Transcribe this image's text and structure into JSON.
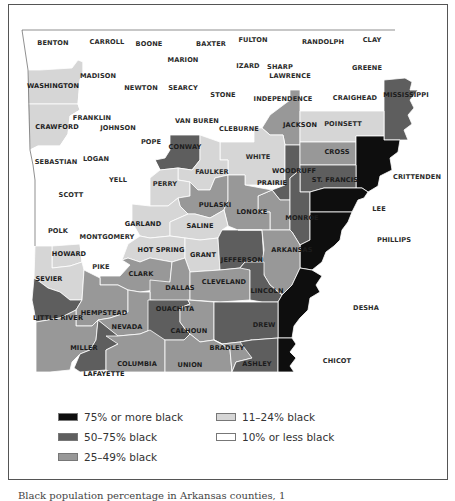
{
  "map": {
    "title": "Arkansas counties by percentage black population",
    "colors": {
      "c75plus": "#0e0e0e",
      "c50_75": "#5e5e5e",
      "c25_49": "#989898",
      "c11_24": "#d6d6d6",
      "c10less": "#ffffff",
      "border": "#ffffff",
      "outline": "#444444"
    },
    "counties": [
      {
        "name": "BENTON",
        "category": "10% or less black"
      },
      {
        "name": "CARROLL",
        "category": "10% or less black"
      },
      {
        "name": "BOONE",
        "category": "10% or less black"
      },
      {
        "name": "BAXTER",
        "category": "10% or less black"
      },
      {
        "name": "FULTON",
        "category": "10% or less black"
      },
      {
        "name": "RANDOLPH",
        "category": "10% or less black"
      },
      {
        "name": "CLAY",
        "category": "10% or less black"
      },
      {
        "name": "MARION",
        "category": "10% or less black"
      },
      {
        "name": "IZARD",
        "category": "10% or less black"
      },
      {
        "name": "SHARP",
        "category": "10% or less black"
      },
      {
        "name": "GREENE",
        "category": "10% or less black"
      },
      {
        "name": "WASHINGTON",
        "category": "11–24% black"
      },
      {
        "name": "MADISON",
        "category": "10% or less black"
      },
      {
        "name": "NEWTON",
        "category": "10% or less black"
      },
      {
        "name": "SEARCY",
        "category": "10% or less black"
      },
      {
        "name": "STONE",
        "category": "10% or less black"
      },
      {
        "name": "LAWRENCE",
        "category": "10% or less black"
      },
      {
        "name": "INDEPENDENCE",
        "category": "10% or less black"
      },
      {
        "name": "CRAIGHEAD",
        "category": "10% or less black"
      },
      {
        "name": "MISSISSIPPI",
        "category": "50–75% black"
      },
      {
        "name": "CRAWFORD",
        "category": "11–24% black"
      },
      {
        "name": "FRANKLIN",
        "category": "10% or less black"
      },
      {
        "name": "JOHNSON",
        "category": "10% or less black"
      },
      {
        "name": "VAN BUREN",
        "category": "10% or less black"
      },
      {
        "name": "CLEBURNE",
        "category": "10% or less black"
      },
      {
        "name": "JACKSON",
        "category": "25–49% black"
      },
      {
        "name": "POINSETT",
        "category": "11–24% black"
      },
      {
        "name": "SEBASTIAN",
        "category": "10% or less black"
      },
      {
        "name": "LOGAN",
        "category": "10% or less black"
      },
      {
        "name": "POPE",
        "category": "10% or less black"
      },
      {
        "name": "CONWAY",
        "category": "50–75% black"
      },
      {
        "name": "WHITE",
        "category": "11–24% black"
      },
      {
        "name": "CROSS",
        "category": "25–49% black"
      },
      {
        "name": "CRITTENDEN",
        "category": "75% or more black"
      },
      {
        "name": "FAULKER",
        "category": "11–24% black"
      },
      {
        "name": "WOODRUFF",
        "category": "50–75% black"
      },
      {
        "name": "ST. FRANCIS",
        "category": "50–75% black"
      },
      {
        "name": "SCOTT",
        "category": "10% or less black"
      },
      {
        "name": "YELL",
        "category": "10% or less black"
      },
      {
        "name": "PERRY",
        "category": "11–24% black"
      },
      {
        "name": "PRAIRIE",
        "category": "25–49% black"
      },
      {
        "name": "PULASKI",
        "category": "25–49% black"
      },
      {
        "name": "LONOKE",
        "category": "25–49% black"
      },
      {
        "name": "MONROE",
        "category": "50–75% black"
      },
      {
        "name": "LEE",
        "category": "75% or more black"
      },
      {
        "name": "GARLAND",
        "category": "11–24% black"
      },
      {
        "name": "SALINE",
        "category": "11–24% black"
      },
      {
        "name": "POLK",
        "category": "10% or less black"
      },
      {
        "name": "MONTGOMERY",
        "category": "10% or less black"
      },
      {
        "name": "PHILLIPS",
        "category": "75% or more black"
      },
      {
        "name": "HOWARD",
        "category": "11–24% black"
      },
      {
        "name": "HOT SPRING",
        "category": "11–24% black"
      },
      {
        "name": "GRANT",
        "category": "11–24% black"
      },
      {
        "name": "JEFFERSON",
        "category": "50–75% black"
      },
      {
        "name": "ARKANSAS",
        "category": "25–49% black"
      },
      {
        "name": "PIKE",
        "category": "10% or less black"
      },
      {
        "name": "SEVIER",
        "category": "11–24% black"
      },
      {
        "name": "CLARK",
        "category": "25–49% black"
      },
      {
        "name": "DALLAS",
        "category": "25–49% black"
      },
      {
        "name": "CLEVELAND",
        "category": "25–49% black"
      },
      {
        "name": "LINCOLN",
        "category": "50–75% black"
      },
      {
        "name": "LITTLE RIVER",
        "category": "50–75% black"
      },
      {
        "name": "HEMPSTEAD",
        "category": "25–49% black"
      },
      {
        "name": "DESHA",
        "category": "75% or more black"
      },
      {
        "name": "NEVADA",
        "category": "25–49% black"
      },
      {
        "name": "OUACHITA",
        "category": "50–75% black"
      },
      {
        "name": "CALHOUN",
        "category": "25–49% black"
      },
      {
        "name": "DREW",
        "category": "50–75% black"
      },
      {
        "name": "BRADLEY",
        "category": "25–49% black"
      },
      {
        "name": "MILLER",
        "category": "25–49% black"
      },
      {
        "name": "COLUMBIA",
        "category": "25–49% black"
      },
      {
        "name": "UNION",
        "category": "25–49% black"
      },
      {
        "name": "ASHLEY",
        "category": "50–75% black"
      },
      {
        "name": "LAFAYETTE",
        "category": "50–75% black"
      },
      {
        "name": "CHICOT",
        "category": "75% or more black"
      }
    ]
  },
  "labels": {
    "benton": "BENTON",
    "carroll": "CARROLL",
    "boone": "BOONE",
    "baxter": "BAXTER",
    "fulton": "FULTON",
    "randolph": "RANDOLPH",
    "clay": "CLAY",
    "marion": "MARION",
    "izard": "IZARD",
    "sharp": "SHARP",
    "greene": "GREENE",
    "washington": "WASHINGTON",
    "madison": "MADISON",
    "newton": "NEWTON",
    "searcy": "SEARCY",
    "stone": "STONE",
    "lawrence": "LAWRENCE",
    "independence": "INDEPENDENCE",
    "craighead": "CRAIGHEAD",
    "mississippi": "MISSISSIPPI",
    "crawford": "CRAWFORD",
    "franklin": "FRANKLIN",
    "johnson": "JOHNSON",
    "vanburen": "VAN BUREN",
    "cleburne": "CLEBURNE",
    "jackson": "JACKSON",
    "poinsett": "POINSETT",
    "sebastian": "SEBASTIAN",
    "logan": "LOGAN",
    "pope": "POPE",
    "conway": "CONWAY",
    "white": "WHITE",
    "cross": "CROSS",
    "crittenden": "CRITTENDEN",
    "faulker": "FAULKER",
    "woodruff": "WOODRUFF",
    "stfrancis": "ST. FRANCIS",
    "scott": "SCOTT",
    "yell": "YELL",
    "perry": "PERRY",
    "prairie": "PRAIRIE",
    "pulaski": "PULASKI",
    "lonoke": "LONOKE",
    "monroe": "MONROE",
    "lee": "LEE",
    "garland": "GARLAND",
    "saline": "SALINE",
    "polk": "POLK",
    "montgomery": "MONTGOMERY",
    "phillips": "PHILLIPS",
    "howard": "HOWARD",
    "hotspring": "HOT SPRING",
    "grant": "GRANT",
    "jefferson": "JEFFERSON",
    "arkansas": "ARKANSAS",
    "pike": "PIKE",
    "sevier": "SEVIER",
    "clark": "CLARK",
    "dallas": "DALLAS",
    "cleveland": "CLEVELAND",
    "lincoln": "LINCOLN",
    "littleriver": "LITTLE RIVER",
    "hempstead": "HEMPSTEAD",
    "desha": "DESHA",
    "nevada": "NEVADA",
    "ouachita": "OUACHITA",
    "calhoun": "CALHOUN",
    "drew": "DREW",
    "bradley": "BRADLEY",
    "miller": "MILLER",
    "columbia": "COLUMBIA",
    "union": "UNION",
    "ashley": "ASHLEY",
    "lafayette": "LAFAYETTE",
    "chicot": "CHICOT"
  },
  "legend": {
    "items": [
      {
        "label": "75% or more black",
        "color": "#0e0e0e"
      },
      {
        "label": "50–75% black",
        "color": "#5e5e5e"
      },
      {
        "label": "25–49% black",
        "color": "#989898"
      },
      {
        "label": "11–24% black",
        "color": "#d6d6d6"
      },
      {
        "label": "10% or less black",
        "color": "#ffffff"
      }
    ]
  },
  "caption": "Black population percentage in Arkansas counties, 1"
}
